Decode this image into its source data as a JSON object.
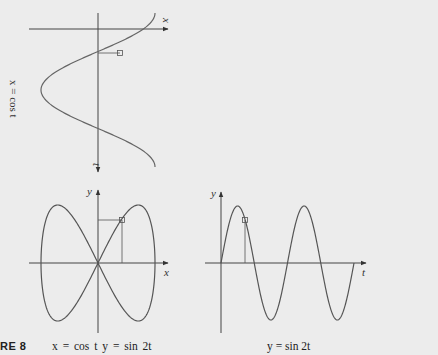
{
  "figure": {
    "number_label": "RE 8",
    "top_panel": {
      "side_label": "x = cos t",
      "horizontal_axis_label": "x",
      "vertical_axis_label": "t"
    },
    "left_panel": {
      "caption": "x = cos t    y = sin 2t",
      "x_axis_label": "x",
      "y_axis_label": "y"
    },
    "right_panel": {
      "caption": "y = sin 2t",
      "x_axis_label": "t",
      "y_axis_label": "y"
    },
    "colors": {
      "background": "#ececec",
      "axis": "#333333",
      "curve": "#555555"
    }
  },
  "chart_data": [
    {
      "type": "line",
      "title": "x = cos t (plotted with t axis pointing down)",
      "xlabel": "x",
      "ylabel": "t",
      "x": "cos t",
      "t_range": [
        0,
        6.283
      ],
      "marker": {
        "t": 0.785,
        "x": 0.707
      }
    },
    {
      "type": "line",
      "title": "x = cos t, y = sin 2t",
      "xlabel": "x",
      "ylabel": "y",
      "parametric": {
        "x": "cos t",
        "y": "sin 2t"
      },
      "t_range": [
        0,
        6.283
      ],
      "xlim": [
        -1,
        1
      ],
      "ylim": [
        -1,
        1
      ],
      "marker": {
        "x": 0.707,
        "y": 1.0
      }
    },
    {
      "type": "line",
      "title": "y = sin 2t",
      "xlabel": "t",
      "ylabel": "y",
      "y": "sin 2t",
      "t_range": [
        0,
        6.283
      ],
      "ylim": [
        -1,
        1
      ],
      "marker": {
        "t": 0.785,
        "y": 1.0
      }
    }
  ]
}
